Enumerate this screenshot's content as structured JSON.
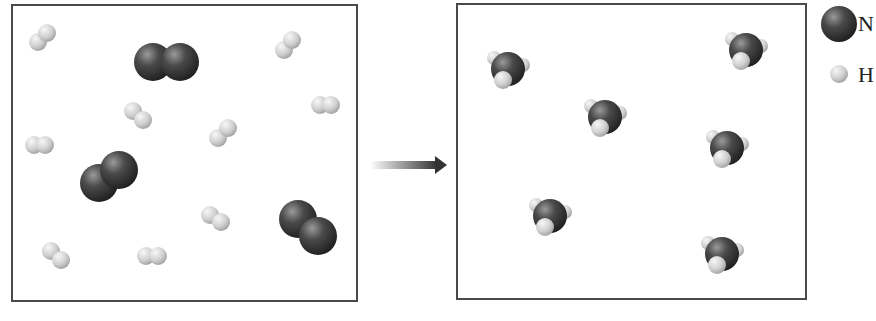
{
  "diagram": {
    "title": "",
    "reactants_box": {
      "x": 11,
      "y": 4,
      "w": 347,
      "h": 298,
      "n2_molecules": [
        {
          "atoms": [
            [
              153,
              62
            ],
            [
              180,
              62
            ]
          ]
        },
        {
          "atoms": [
            [
              99,
              183
            ],
            [
              119,
              170
            ]
          ]
        },
        {
          "atoms": [
            [
              298,
              219
            ],
            [
              318,
              236
            ]
          ]
        }
      ],
      "h2_molecules": [
        {
          "atoms": [
            [
              38,
              42
            ],
            [
              47,
              33
            ]
          ]
        },
        {
          "atoms": [
            [
              284,
              50
            ],
            [
              292,
              40
            ]
          ]
        },
        {
          "atoms": [
            [
              133,
              111
            ],
            [
              143,
              120
            ]
          ]
        },
        {
          "atoms": [
            [
              218,
              138
            ],
            [
              228,
              128
            ]
          ]
        },
        {
          "atoms": [
            [
              320,
              105
            ],
            [
              331,
              105
            ]
          ]
        },
        {
          "atoms": [
            [
              34,
              145
            ],
            [
              45,
              145
            ]
          ]
        },
        {
          "atoms": [
            [
              210,
              215
            ],
            [
              221,
              222
            ]
          ]
        },
        {
          "atoms": [
            [
              51,
              251
            ],
            [
              61,
              260
            ]
          ]
        },
        {
          "atoms": [
            [
              146,
              256
            ],
            [
              158,
              256
            ]
          ]
        }
      ]
    },
    "arrow": {
      "x1": 370,
      "x2": 447,
      "y": 165,
      "color": "#333333"
    },
    "products_box": {
      "x": 456,
      "y": 3,
      "w": 351,
      "h": 297,
      "nh3_molecules": [
        {
          "n": [
            508,
            69
          ]
        },
        {
          "n": [
            746,
            50
          ]
        },
        {
          "n": [
            605,
            117
          ]
        },
        {
          "n": [
            727,
            148
          ]
        },
        {
          "n": [
            550,
            216
          ]
        },
        {
          "n": [
            722,
            254
          ]
        }
      ]
    },
    "legend": {
      "items": [
        {
          "label": "N",
          "symbol": "nitrogen-atom",
          "x": 839,
          "y": 24,
          "r": 18
        },
        {
          "label": "H",
          "symbol": "hydrogen-atom",
          "x": 839,
          "y": 74,
          "r": 9
        }
      ]
    },
    "colors": {
      "nitrogen": "#3a3a3a",
      "nitrogen_highlight": "#8a8a8a",
      "hydrogen": "#c9c9c9",
      "hydrogen_highlight": "#f2f2f2",
      "border": "#4a4a4a"
    },
    "radii": {
      "n": 19,
      "h": 9,
      "nh3_n": 17,
      "nh3_h": 9
    }
  }
}
